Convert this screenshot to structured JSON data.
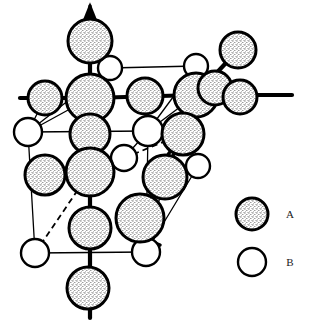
{
  "figure": {
    "background_color": "#ffffff",
    "line_color": "#000000",
    "width": 312,
    "height": 327
  },
  "legend": {
    "items": [
      {
        "key": "A",
        "label": "A",
        "swatch_name": "stippled-circle",
        "fill": "#ffffff",
        "pattern": "stipple",
        "stroke": "#000000",
        "cx": 252,
        "cy": 214,
        "r": 16
      },
      {
        "key": "B",
        "label": "B",
        "swatch_name": "open-circle",
        "fill": "#ffffff",
        "pattern": "none",
        "stroke": "#000000",
        "cx": 252,
        "cy": 262,
        "r": 14
      }
    ],
    "label_x": 290
  },
  "atoms": {
    "A": [
      {
        "id": "a1",
        "cx": 90,
        "cy": 41,
        "r": 22
      },
      {
        "id": "a2",
        "cx": 45,
        "cy": 98,
        "r": 17
      },
      {
        "id": "a3",
        "cx": 90,
        "cy": 98,
        "r": 24
      },
      {
        "id": "a4",
        "cx": 145,
        "cy": 96,
        "r": 18
      },
      {
        "id": "a5",
        "cx": 196,
        "cy": 95,
        "r": 22
      },
      {
        "id": "a6",
        "cx": 215,
        "cy": 88,
        "r": 17
      },
      {
        "id": "a7",
        "cx": 238,
        "cy": 50,
        "r": 18
      },
      {
        "id": "a8",
        "cx": 240,
        "cy": 97,
        "r": 17
      },
      {
        "id": "a9",
        "cx": 90,
        "cy": 134,
        "r": 20
      },
      {
        "id": "a10",
        "cx": 183,
        "cy": 134,
        "r": 21
      },
      {
        "id": "a11",
        "cx": 45,
        "cy": 175,
        "r": 20
      },
      {
        "id": "a12",
        "cx": 90,
        "cy": 172,
        "r": 24
      },
      {
        "id": "a13",
        "cx": 165,
        "cy": 177,
        "r": 22
      },
      {
        "id": "a14",
        "cx": 140,
        "cy": 218,
        "r": 24
      },
      {
        "id": "a15",
        "cx": 90,
        "cy": 228,
        "r": 21
      },
      {
        "id": "a16",
        "cx": 88,
        "cy": 288,
        "r": 21
      }
    ],
    "B": [
      {
        "id": "b1",
        "cx": 110,
        "cy": 68,
        "r": 12
      },
      {
        "id": "b2",
        "cx": 196,
        "cy": 66,
        "r": 12
      },
      {
        "id": "b3",
        "cx": 28,
        "cy": 132,
        "r": 14
      },
      {
        "id": "b4",
        "cx": 148,
        "cy": 131,
        "r": 15
      },
      {
        "id": "b5",
        "cx": 124,
        "cy": 158,
        "r": 13
      },
      {
        "id": "b6",
        "cx": 198,
        "cy": 166,
        "r": 12
      },
      {
        "id": "b7",
        "cx": 35,
        "cy": 253,
        "r": 14
      },
      {
        "id": "b8",
        "cx": 146,
        "cy": 252,
        "r": 14
      }
    ]
  },
  "bonds": {
    "thick": [
      {
        "x1": 90,
        "y1": 13,
        "x2": 90,
        "y2": 98
      },
      {
        "x1": 20,
        "y1": 98,
        "x2": 90,
        "y2": 98
      },
      {
        "x1": 90,
        "y1": 98,
        "x2": 196,
        "y2": 95
      },
      {
        "x1": 196,
        "y1": 95,
        "x2": 292,
        "y2": 95
      },
      {
        "x1": 196,
        "y1": 95,
        "x2": 238,
        "y2": 50
      },
      {
        "x1": 90,
        "y1": 98,
        "x2": 90,
        "y2": 172
      },
      {
        "x1": 90,
        "y1": 172,
        "x2": 90,
        "y2": 318
      },
      {
        "x1": 90,
        "y1": 98,
        "x2": 110,
        "y2": 68
      },
      {
        "x1": 196,
        "y1": 95,
        "x2": 196,
        "y2": 66
      },
      {
        "x1": 165,
        "y1": 177,
        "x2": 198,
        "y2": 166
      },
      {
        "x1": 183,
        "y1": 134,
        "x2": 196,
        "y2": 95
      }
    ],
    "thin": [
      {
        "x1": 110,
        "y1": 68,
        "x2": 196,
        "y2": 66
      },
      {
        "x1": 28,
        "y1": 132,
        "x2": 148,
        "y2": 131
      },
      {
        "x1": 28,
        "y1": 132,
        "x2": 90,
        "y2": 98
      },
      {
        "x1": 148,
        "y1": 131,
        "x2": 196,
        "y2": 95
      },
      {
        "x1": 110,
        "y1": 68,
        "x2": 28,
        "y2": 132
      },
      {
        "x1": 196,
        "y1": 66,
        "x2": 148,
        "y2": 131
      },
      {
        "x1": 28,
        "y1": 132,
        "x2": 35,
        "y2": 253
      },
      {
        "x1": 148,
        "y1": 131,
        "x2": 146,
        "y2": 252
      },
      {
        "x1": 35,
        "y1": 253,
        "x2": 146,
        "y2": 252
      },
      {
        "x1": 146,
        "y1": 252,
        "x2": 198,
        "y2": 166
      },
      {
        "x1": 165,
        "y1": 177,
        "x2": 146,
        "y2": 252
      },
      {
        "x1": 45,
        "y1": 98,
        "x2": 28,
        "y2": 132
      },
      {
        "x1": 124,
        "y1": 158,
        "x2": 148,
        "y2": 131
      }
    ],
    "dashed": [
      {
        "x1": 35,
        "y1": 253,
        "x2": 90,
        "y2": 172
      },
      {
        "x1": 124,
        "y1": 158,
        "x2": 183,
        "y2": 134
      }
    ],
    "arrows": [
      {
        "x1": 196,
        "y1": 95,
        "x2": 165,
        "y2": 177,
        "name": "arrow-to-a13"
      },
      {
        "x1": 183,
        "y1": 134,
        "x2": 148,
        "y2": 182,
        "name": "arrow-down-left"
      },
      {
        "x1": 90,
        "y1": 13,
        "x2": 90,
        "y2": 6,
        "name": "arrow-up-axis"
      },
      {
        "x1": 160,
        "y1": 245,
        "x2": 128,
        "y2": 232,
        "name": "arrow-to-a14"
      }
    ]
  }
}
